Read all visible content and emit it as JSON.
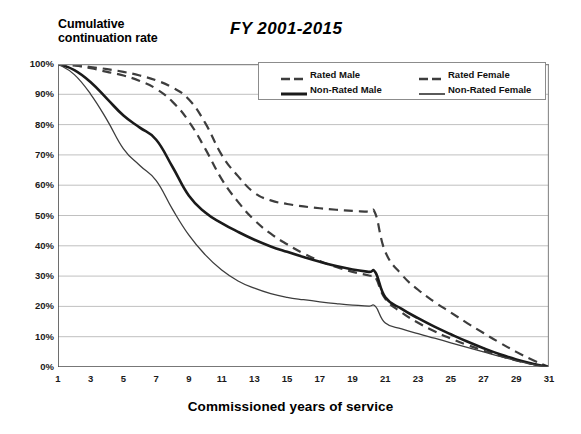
{
  "title": "FY 2001-2015",
  "y_axis_title_line1": "Cumulative",
  "y_axis_title_line2": "continuation rate",
  "x_axis_title": "Commissioned years of service",
  "legend": {
    "items": [
      {
        "label": "Rated Male",
        "style": "dashed",
        "color": "#3d3d3d",
        "width": 2.2
      },
      {
        "label": "Rated Female",
        "style": "dashed",
        "color": "#3d3d3d",
        "width": 2.2
      },
      {
        "label": "Non-Rated Male",
        "style": "solid",
        "color": "#1a1a1a",
        "width": 2.6
      },
      {
        "label": "Non-Rated Female",
        "style": "solid",
        "color": "#3d3d3d",
        "width": 1.3
      }
    ]
  },
  "chart_data": {
    "type": "line",
    "title": "FY 2001-2015",
    "xlabel": "Commissioned years of service",
    "ylabel": "Cumulative continuation rate",
    "xlim": [
      1,
      31
    ],
    "ylim": [
      0,
      100
    ],
    "grid": true,
    "legend_position": "top-right-inside",
    "x_ticks": [
      1,
      3,
      5,
      7,
      9,
      11,
      13,
      15,
      17,
      19,
      21,
      23,
      25,
      27,
      29,
      31
    ],
    "x_tick_labels": [
      "1",
      "3",
      "5",
      "7",
      "9",
      "11",
      "13",
      "15",
      "17",
      "19",
      "21",
      "23",
      "25",
      "27",
      "29",
      "31"
    ],
    "y_ticks": [
      0,
      10,
      20,
      30,
      40,
      50,
      60,
      70,
      80,
      90,
      100
    ],
    "y_tick_labels": [
      "0%",
      "10%",
      "20%",
      "30%",
      "40%",
      "50%",
      "60%",
      "70%",
      "80%",
      "90%",
      "100%"
    ],
    "x": [
      1,
      2,
      3,
      4,
      5,
      6,
      7,
      8,
      9,
      10,
      11,
      12,
      13,
      14,
      15,
      16,
      17,
      18,
      19,
      20,
      20.4,
      21,
      22,
      23,
      24,
      25,
      26,
      27,
      28,
      29,
      30,
      31
    ],
    "series": [
      {
        "name": "Rated Male",
        "style": "dashed",
        "values": [
          100,
          99.5,
          98.6,
          97.4,
          96.2,
          94.4,
          91.8,
          87.5,
          81.0,
          72.0,
          62.0,
          54.5,
          48.5,
          44.0,
          40.5,
          37.5,
          35.0,
          33.0,
          31.4,
          30.2,
          29.5,
          22.5,
          18.0,
          14.6,
          11.8,
          9.4,
          7.3,
          5.4,
          3.7,
          2.2,
          1.0,
          0
        ]
      },
      {
        "name": "Rated Female",
        "style": "dashed",
        "values": [
          100,
          99.6,
          99.0,
          98.3,
          97.4,
          96.2,
          94.6,
          92.2,
          88.3,
          80.5,
          70.0,
          63.0,
          57.5,
          55.0,
          53.8,
          53.0,
          52.4,
          51.9,
          51.5,
          51.2,
          50.5,
          38.0,
          30.5,
          25.5,
          21.5,
          18.0,
          14.5,
          11.2,
          8.0,
          5.0,
          2.3,
          0
        ]
      },
      {
        "name": "Non-Rated Male",
        "style": "solid",
        "values": [
          100,
          98.0,
          94.0,
          88.5,
          83.0,
          79.0,
          75.0,
          66.0,
          56.5,
          51.0,
          47.5,
          44.6,
          42.0,
          39.8,
          38.0,
          36.3,
          34.7,
          33.3,
          32.2,
          31.4,
          31.2,
          23.0,
          19.2,
          16.1,
          13.3,
          10.8,
          8.4,
          6.2,
          4.2,
          2.5,
          1.1,
          0
        ]
      },
      {
        "name": "Non-Rated Female",
        "style": "solid",
        "values": [
          100,
          96.5,
          90.0,
          81.5,
          72.0,
          66.5,
          61.5,
          52.0,
          43.5,
          37.0,
          32.0,
          28.4,
          26.0,
          24.2,
          23.0,
          22.2,
          21.5,
          20.9,
          20.4,
          20.1,
          20.0,
          14.5,
          12.6,
          11.0,
          9.5,
          8.0,
          6.5,
          5.0,
          3.5,
          2.1,
          0.9,
          0
        ]
      }
    ]
  }
}
